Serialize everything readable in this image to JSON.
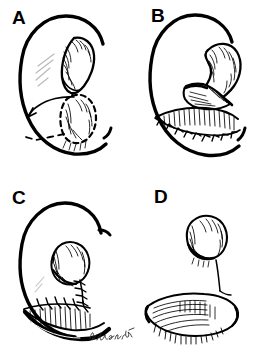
{
  "figure": {
    "type": "medical-surgical-technique-illustration",
    "style": "pen-and-ink line drawing with hatched shading",
    "background_color": "#ffffff",
    "ink_color": "#000000",
    "width_px": 264,
    "height_px": 356,
    "layout": "2x2 grid of panels, no dividing rules, white gutters"
  },
  "panels": [
    {
      "id": "A",
      "label": "A",
      "position": "top-left",
      "caption": "Bilobed flap design marked on the ear: solid upper lobe over the defect and dashed lower lobe outline, with a curved arrow showing the direction of transposition.",
      "elements": [
        "ear-outline-helix",
        "upper-lobe-solid-outline",
        "lower-lobe-dashed-outline",
        "transposition-arrow",
        "hatching-shading"
      ]
    },
    {
      "id": "B",
      "label": "B",
      "position": "top-right",
      "caption": "The flap is elevated, exposing the pedicle and undersurface; the donor site below is closed with interrupted sutures.",
      "elements": [
        "ear-outline-helix",
        "elevated-flap",
        "flap-pedicle",
        "flap-undersurface-hatching",
        "donor-site-suture-line",
        "hatching-shading"
      ]
    },
    {
      "id": "C",
      "label": "C",
      "position": "bottom-left",
      "caption": "Completed closure: the transposed flap is inset with a vertical suture line and the horizontal donor closure runs along the lower ear.",
      "elements": [
        "ear-outline-helix",
        "inset-flap",
        "vertical-suture-line",
        "horizontal-suture-line",
        "hatching-shading",
        "artist-signature"
      ]
    },
    {
      "id": "D",
      "label": "D",
      "position": "bottom-right",
      "caption": "Final result shown in isolation: the reconstructed tragus above and the restored earlobe below, without the surrounding ear outline.",
      "elements": [
        "reconstructed-tragus",
        "connecting-contour",
        "reconstructed-earlobe",
        "hatching-shading"
      ]
    }
  ],
  "signature": {
    "text": "D. Leber, MD",
    "legible": false,
    "note": "Cursive artist signature in the lower-right of panel C",
    "location": "panel-C-lower-right"
  }
}
